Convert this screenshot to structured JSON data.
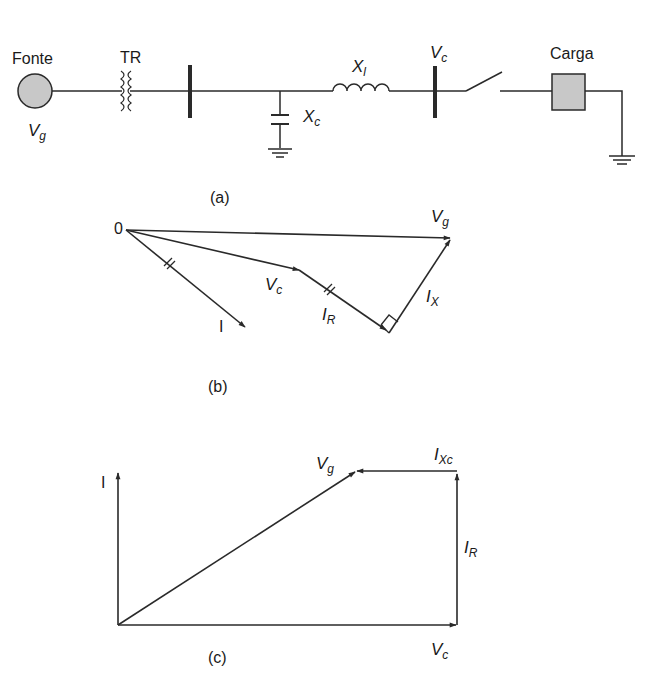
{
  "figure_a": {
    "source_label": "Fonte",
    "source_voltage": "V",
    "source_voltage_sub": "g",
    "transformer_label": "TR",
    "capacitor_label": "X",
    "capacitor_sub": "c",
    "inductor_label": "X",
    "inductor_sub": "l",
    "bus_voltage": "V",
    "bus_voltage_sub": "c",
    "load_label": "Carga",
    "caption": "(a)"
  },
  "figure_b": {
    "origin_label": "0",
    "vg_label": "V",
    "vg_sub": "g",
    "vc_label": "V",
    "vc_sub": "c",
    "i_label": "I",
    "ir_label": "I",
    "ir_sub": "R",
    "ix_label": "I",
    "ix_sub": "X",
    "caption": "(b)"
  },
  "figure_c": {
    "i_label": "I",
    "vg_label": "V",
    "vg_sub": "g",
    "ixc_label": "I",
    "ixc_sub": "Xc",
    "ir_label": "I",
    "ir_sub": "R",
    "vc_label": "V",
    "vc_sub": "c",
    "caption": "(c)"
  },
  "colors": {
    "line": "#2a2a2a",
    "fill_gray": "#c8c8c8"
  }
}
